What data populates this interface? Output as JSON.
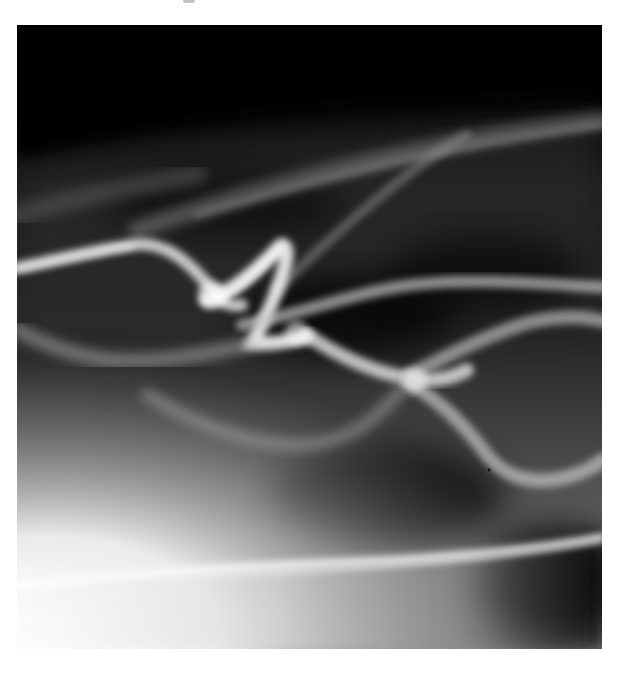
{
  "page": {
    "background": "#ffffff"
  },
  "photo": {
    "subject": "abstract light waves",
    "tones": {
      "shadow": "#000000",
      "mid": "#3a3a3a",
      "highlight": "#f4f4f4"
    }
  }
}
